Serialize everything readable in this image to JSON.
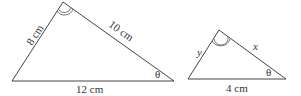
{
  "diagram": {
    "type": "similar-triangles",
    "triangles": [
      {
        "id": "large",
        "vertices": {
          "left": [
            12,
            81
          ],
          "top": [
            63,
            2
          ],
          "right": [
            174,
            81
          ]
        },
        "sides": {
          "left": "8 cm",
          "right": "10 cm",
          "base": "12 cm"
        },
        "angle_marks": {
          "top": "double-arc",
          "right": "θ"
        }
      },
      {
        "id": "small",
        "vertices": {
          "left": [
            188,
            79
          ],
          "top": [
            219,
            30
          ],
          "right": [
            286,
            79
          ]
        },
        "sides": {
          "left": "y",
          "right": "x",
          "base": "4 cm"
        },
        "angle_marks": {
          "top": "double-arc",
          "right": "θ"
        }
      }
    ],
    "stroke_color": "#444444"
  }
}
